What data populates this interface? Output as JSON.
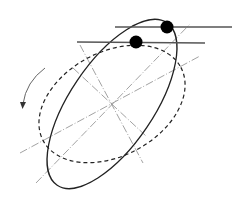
{
  "diagram": {
    "colors": {
      "stroke": "#222222",
      "axis": "#8a8a8a",
      "tangent": "#555555",
      "dot": "#000000",
      "background": "#ffffff"
    },
    "elements": [
      {
        "name": "solid-ellipse",
        "style": "solid"
      },
      {
        "name": "dashed-ellipse",
        "style": "dashed"
      },
      {
        "name": "rotation-arrow",
        "direction": "counter-clockwise"
      },
      {
        "name": "contact-dot",
        "count": 2
      },
      {
        "name": "tangent-line",
        "count": 2
      }
    ]
  }
}
